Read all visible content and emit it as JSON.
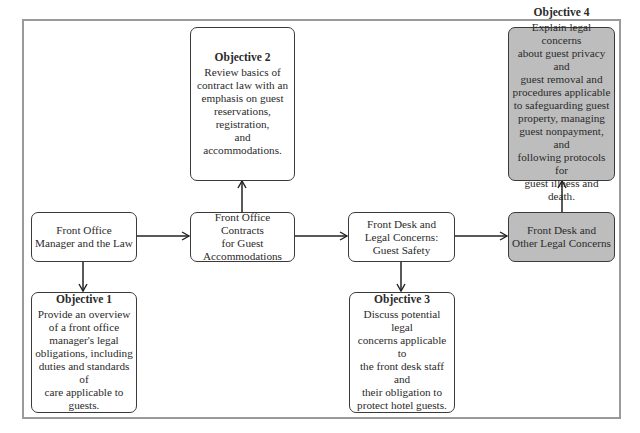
{
  "diagram": {
    "topics": [
      {
        "id": "t1",
        "label": "Front Office\nManager and the Law"
      },
      {
        "id": "t2",
        "label": "Front Office Contracts\nfor Guest\nAccommodations"
      },
      {
        "id": "t3",
        "label": "Front Desk and\nLegal Concerns:\nGuest Safety"
      },
      {
        "id": "t4",
        "label": "Front Desk and\nOther Legal Concerns"
      }
    ],
    "objectives": [
      {
        "id": "o1",
        "title": "Objective 1",
        "text": "Provide an overview\nof a front office\nmanager's legal\nobligations, including\nduties and standards of\ncare applicable to\nguests."
      },
      {
        "id": "o2",
        "title": "Objective 2",
        "text": "Review basics of\ncontract law with an\nemphasis on guest\nreservations,\nregistration,\nand accommodations."
      },
      {
        "id": "o3",
        "title": "Objective 3",
        "text": "Discuss potential legal\nconcerns applicable to\nthe front desk staff and\ntheir obligation to\nprotect hotel guests."
      },
      {
        "id": "o4",
        "title": "Objective 4",
        "text": "Explain legal concerns\nabout guest privacy and\nguest removal and\nprocedures applicable\nto safeguarding guest\nproperty, managing\nguest nonpayment, and\nfollowing protocols for\nguest illness and death."
      }
    ],
    "edges": [
      {
        "from": "t1",
        "to": "t2"
      },
      {
        "from": "t2",
        "to": "t3"
      },
      {
        "from": "t3",
        "to": "t4"
      },
      {
        "from": "t1",
        "to": "o1"
      },
      {
        "from": "t2",
        "to": "o2"
      },
      {
        "from": "t3",
        "to": "o3"
      },
      {
        "from": "t4",
        "to": "o4"
      }
    ],
    "colors": {
      "highlight_fill": "#bdbdbd",
      "frame": "#9a9a9a",
      "stroke": "#3a3a3a"
    }
  }
}
